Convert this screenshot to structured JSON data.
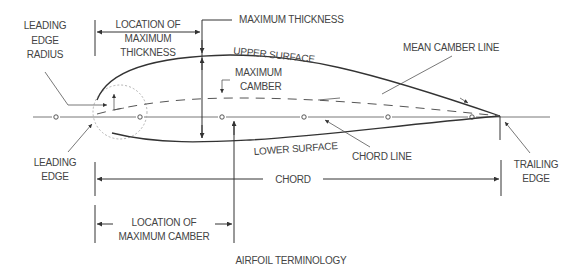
{
  "diagram": {
    "title": "AIRFOIL TERMINOLOGY",
    "labels": {
      "leading_edge_radius": [
        "LEADING",
        "EDGE",
        "RADIUS"
      ],
      "location_max_thickness": [
        "LOCATION OF",
        "MAXIMUM",
        "THICKNESS"
      ],
      "maximum_thickness": "MAXIMUM THICKNESS",
      "upper_surface": "UPPER SURFACE",
      "mean_camber_line": "MEAN CAMBER LINE",
      "maximum_camber": [
        "MAXIMUM",
        "CAMBER"
      ],
      "leading_edge": [
        "LEADING",
        "EDGE"
      ],
      "lower_surface": "LOWER SURFACE",
      "chord_line": "CHORD LINE",
      "trailing_edge": [
        "TRAILING",
        "EDGE"
      ],
      "chord": "CHORD",
      "location_max_camber": [
        "LOCATION OF",
        "MAXIMUM CAMBER"
      ]
    },
    "colors": {
      "line": "#333333",
      "text": "#444444",
      "circle": "#aaaaaa"
    }
  }
}
